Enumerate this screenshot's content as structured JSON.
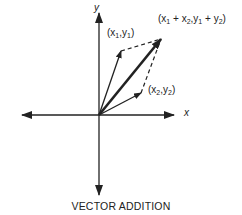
{
  "diagram": {
    "caption": "VECTOR ADDITION",
    "axes": {
      "x_label": "x",
      "y_label": "y"
    },
    "vectors": [
      {
        "name": "v1",
        "label": "(x1,y1)",
        "label_html": "(x<sub>1</sub>,y<sub>1</sub>)"
      },
      {
        "name": "v2",
        "label": "(x2,y2)",
        "label_html": "(x<sub>2</sub>,y<sub>2</sub>)"
      },
      {
        "name": "sum",
        "label": "(x1 + x2,y1 + y2)",
        "label_html": "(x<sub>1</sub> + x<sub>2</sub>,y<sub>1</sub> + y<sub>2</sub>)"
      }
    ],
    "colors": {
      "ink": "#222222",
      "background": "#ffffff"
    }
  }
}
